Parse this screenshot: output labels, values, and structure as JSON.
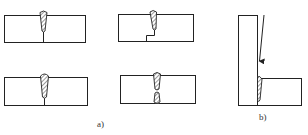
{
  "diagram": {
    "colors": {
      "line": "#222222",
      "background": "#ffffff",
      "label": "#333333"
    },
    "group_a": {
      "label": "a)",
      "panels": [
        {
          "name": "butt-weld-single",
          "description": "butt joint with single weld bead, root line below"
        },
        {
          "name": "butt-weld-stepped-backing",
          "description": "butt joint with weld bead and stepped joint at root"
        },
        {
          "name": "butt-weld-full-penetration",
          "description": "butt joint with elongated weld bead through thickness"
        },
        {
          "name": "butt-weld-double-sided",
          "description": "butt joint with weld beads from both sides"
        }
      ]
    },
    "group_b": {
      "label": "b)",
      "panels": [
        {
          "name": "corner-t-joint-weld",
          "description": "vertical plate with horizontal plate, weld bead at joint with arrow indicating weld direction"
        }
      ]
    }
  }
}
